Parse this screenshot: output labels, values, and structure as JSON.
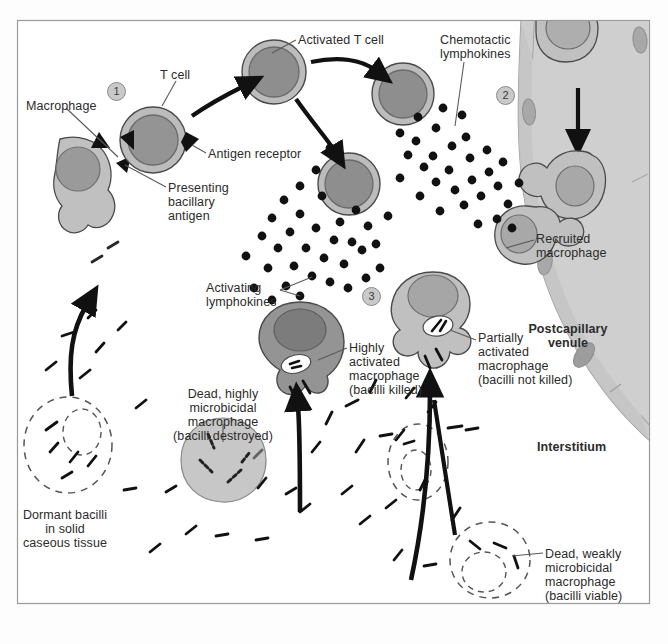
{
  "figure": {
    "frame": {
      "x": 17,
      "y": 20,
      "w": 633,
      "h": 584,
      "border_color": "#9a9a9a",
      "background": "#ffffff"
    }
  },
  "palette": {
    "cell_outer": "#b0b0b0",
    "cell_nucleus": "#8f8f8f",
    "macrophage_light": "#c0c0c0",
    "macrophage_dark": "#949494",
    "vessel_fill": "#cfcfcf",
    "vessel_wall": "#c4c4c4",
    "outline": "#4a4a4a",
    "dot": "#111111",
    "text": "#2b2b2b",
    "bacillus": "#1a1a1a"
  },
  "labels": [
    {
      "id": "macrophage",
      "text": "Macrophage",
      "x": 26,
      "y": 99,
      "align": "left",
      "bold": false
    },
    {
      "id": "t-cell",
      "text": "T cell",
      "x": 160,
      "y": 68,
      "align": "left",
      "bold": false
    },
    {
      "id": "activated-t-cell",
      "text": "Activated T cell",
      "x": 298,
      "y": 33,
      "align": "left",
      "bold": false
    },
    {
      "id": "chemotactic",
      "text": "Chemotactic\nlymphokines",
      "x": 440,
      "y": 33,
      "align": "left",
      "bold": false
    },
    {
      "id": "antigen-receptor",
      "text": "Antigen receptor",
      "x": 208,
      "y": 147,
      "align": "left",
      "bold": false
    },
    {
      "id": "presenting-antigen",
      "text": "Presenting\nbacillary\nantigen",
      "x": 168,
      "y": 181,
      "align": "left",
      "bold": false
    },
    {
      "id": "recruited-macrophage",
      "text": "Recruited\nmacrophage",
      "x": 536,
      "y": 232,
      "align": "left",
      "bold": false
    },
    {
      "id": "activating",
      "text": "Activating\nlymphokines",
      "x": 206,
      "y": 281,
      "align": "left",
      "bold": false
    },
    {
      "id": "postcapillary-venule",
      "text": "Postcapillary\nvenule",
      "x": 568,
      "y": 322,
      "align": "center",
      "bold": true
    },
    {
      "id": "highly-activated",
      "text": "Highly\nactivated\nmacrophage\n(bacilli killed)",
      "x": 349,
      "y": 341,
      "align": "left",
      "bold": false
    },
    {
      "id": "partially-activated",
      "text": "Partially\nactivated\nmacrophage\n(bacilli not killed)",
      "x": 478,
      "y": 331,
      "align": "left",
      "bold": false
    },
    {
      "id": "interstitium",
      "text": "Interstitium",
      "x": 537,
      "y": 440,
      "align": "left",
      "bold": true
    },
    {
      "id": "dead-highly",
      "text": "Dead, highly\nmicrobicidal\nmacrophage\n(bacilli destroyed)",
      "x": 223,
      "y": 387,
      "align": "center",
      "bold": false
    },
    {
      "id": "dormant-bacilli",
      "text": "Dormant bacilli\nin solid\ncaseous tissue",
      "x": 65,
      "y": 508,
      "align": "center",
      "bold": false
    },
    {
      "id": "dead-weakly",
      "text": "Dead, weakly\nmicrobicidal\nmacrophage\n(bacilli viable)",
      "x": 545,
      "y": 547,
      "align": "left",
      "bold": false
    }
  ],
  "step_markers": [
    {
      "id": "step-1",
      "label": "1",
      "x": 107,
      "y": 82
    },
    {
      "id": "step-2",
      "label": "2",
      "x": 496,
      "y": 86
    },
    {
      "id": "step-3",
      "label": "3",
      "x": 362,
      "y": 287
    }
  ],
  "cells": {
    "t_cells": [
      {
        "id": "t-cell-resting",
        "cx": 153,
        "cy": 140,
        "r": 33,
        "nr": 25
      },
      {
        "id": "t-cell-activated",
        "cx": 274,
        "cy": 72,
        "r": 32,
        "nr": 25
      },
      {
        "id": "t-cell-clone-1",
        "cx": 403,
        "cy": 94,
        "r": 31,
        "nr": 24
      },
      {
        "id": "t-cell-clone-2",
        "cx": 349,
        "cy": 184,
        "r": 31,
        "nr": 24
      }
    ],
    "macrophages": [
      {
        "id": "presenting-macrophage",
        "cx": 100,
        "cy": 175,
        "tone": "light"
      },
      {
        "id": "recruited-macrophage-1",
        "cx": 566,
        "cy": 62,
        "tone": "light"
      },
      {
        "id": "recruited-macrophage-2",
        "cx": 572,
        "cy": 180,
        "tone": "light"
      },
      {
        "id": "recruited-macrophage-3",
        "cx": 527,
        "cy": 230,
        "tone": "light"
      },
      {
        "id": "highly-activated-macrophage",
        "cx": 300,
        "cy": 338,
        "tone": "dark"
      },
      {
        "id": "partially-activated-macrophage",
        "cx": 433,
        "cy": 318,
        "tone": "light"
      }
    ],
    "dead_macrophages": [
      {
        "id": "dead-highly-microbicidal",
        "cx": 223,
        "cy": 460,
        "r": 42,
        "style": "solid-gray"
      },
      {
        "id": "dormant-caseous-focus",
        "cx": 68,
        "cy": 445,
        "r": 42,
        "style": "dashed"
      },
      {
        "id": "dead-weakly-microbicidal-left",
        "cx": 418,
        "cy": 460,
        "r": 30,
        "style": "dashed"
      },
      {
        "id": "dead-weakly-microbicidal-bottom",
        "cx": 490,
        "cy": 560,
        "r": 38,
        "style": "dashed"
      }
    ]
  },
  "vessel": {
    "id": "postcapillary-venule-lumen",
    "endothelial_nuclei": 4
  },
  "lymphokine_streams": [
    {
      "id": "chemotactic-lymphokine-dots",
      "count": 38,
      "direction": "toward-venule"
    },
    {
      "id": "activating-lymphokine-dots",
      "count": 34,
      "direction": "toward-macrophages"
    }
  ],
  "arrows": [
    {
      "id": "arrow-activation-to-clone-1",
      "desc": "activated T cell to clone 1"
    },
    {
      "id": "arrow-activation-to-clone-2",
      "desc": "activated T cell to clone 2"
    },
    {
      "id": "arrow-venule-influx",
      "desc": "monocyte influx down the venule"
    },
    {
      "id": "arrow-recycle-left",
      "desc": "dead macrophage back to caseous focus"
    },
    {
      "id": "arrow-to-highly-activated",
      "desc": "bacilli to highly activated macrophage"
    },
    {
      "id": "arrow-to-partially-activated",
      "desc": "bacilli to partially activated macrophage"
    }
  ]
}
